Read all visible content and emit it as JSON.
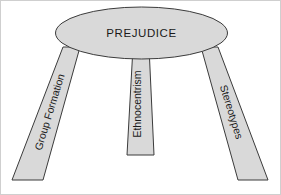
{
  "diagram": {
    "title": "PREJUDICE",
    "type": "three-legged-stool",
    "seat": {
      "label": "PREJUDICE",
      "shape": "ellipse",
      "fill_color": "#d9d9d9",
      "stroke_color": "#3b3b3b"
    },
    "legs": [
      {
        "id": "left",
        "label": "Group Formation",
        "fill_color": "#d9d9d9",
        "stroke_color": "#3b3b3b",
        "rotation_deg": -73
      },
      {
        "id": "center",
        "label": "Ethnocentrism",
        "fill_color": "#d9d9d9",
        "stroke_color": "#3b3b3b",
        "rotation_deg": -90
      },
      {
        "id": "right",
        "label": "Stereotypes",
        "fill_color": "#d9d9d9",
        "stroke_color": "#3b3b3b",
        "rotation_deg": 73
      }
    ],
    "background_color": "#ffffff",
    "border_color": "#cfcfcf"
  }
}
